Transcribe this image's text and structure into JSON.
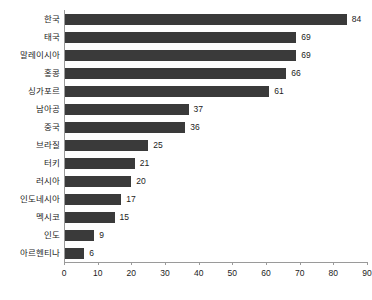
{
  "chart_data": {
    "type": "bar",
    "orientation": "horizontal",
    "title": "",
    "subtitle": "",
    "xlabel": "",
    "ylabel": "",
    "xlim": [
      0,
      90
    ],
    "xticks": [
      0,
      10,
      20,
      30,
      40,
      50,
      60,
      70,
      80,
      90
    ],
    "grid": false,
    "legend": false,
    "bar_color": "#3a3a3a",
    "axis_color": "#9a9a9a",
    "text_color": "#1c1c1c",
    "show_value_labels": true,
    "categories": [
      "한국",
      "태국",
      "말레이시아",
      "홍콩",
      "싱가포르",
      "남아공",
      "중국",
      "브라질",
      "터키",
      "러시아",
      "인도네시아",
      "멕시코",
      "인도",
      "아르헨티나"
    ],
    "values": [
      84,
      69,
      69,
      66,
      61,
      37,
      36,
      25,
      21,
      20,
      17,
      15,
      9,
      6
    ]
  }
}
